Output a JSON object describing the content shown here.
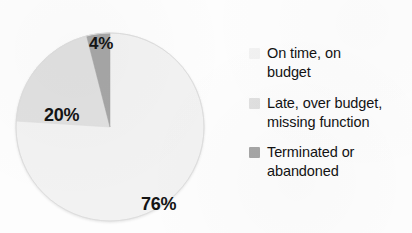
{
  "chart_data": {
    "type": "pie",
    "title": "",
    "subtitle": "",
    "xlabel": "",
    "ylabel": "",
    "legend_position": "right",
    "grid": false,
    "start_angle_deg": 0,
    "direction": "clockwise",
    "categories": [
      "On time, on budget",
      "Late, over budget, missing function",
      "Terminated or abandoned"
    ],
    "values": [
      76,
      20,
      4
    ],
    "value_labels": [
      "76%",
      "20%",
      "4%"
    ],
    "units": "percent",
    "colors": [
      "#f2f2f2",
      "#e0e0e0",
      "#a6a6a6"
    ],
    "slices": [
      {
        "label": "On time, on budget",
        "value": 76,
        "display": "76%",
        "color": "#f2f2f2",
        "start_deg": 0,
        "end_deg": 273.6
      },
      {
        "label": "Late, over budget, missing function",
        "value": 20,
        "display": "20%",
        "color": "#e0e0e0",
        "start_deg": 273.6,
        "end_deg": 345.6
      },
      {
        "label": "Terminated or abandoned",
        "value": 4,
        "display": "4%",
        "color": "#a6a6a6",
        "start_deg": 345.6,
        "end_deg": 360
      }
    ]
  },
  "pie": {
    "labels": {
      "slice_76": "76%",
      "slice_20": "20%",
      "slice_4": "4%"
    }
  },
  "legend": {
    "items": [
      {
        "label": "On time, on budget",
        "line1": "On time, on",
        "line2": "budget",
        "color": "#f2f2f2"
      },
      {
        "label": "Late, over budget, missing function",
        "line1": "Late, over budget,",
        "line2": "missing function",
        "color": "#e0e0e0"
      },
      {
        "label": "Terminated or abandoned",
        "line1": "Terminated or",
        "line2": "abandoned",
        "color": "#a6a6a6"
      }
    ]
  }
}
